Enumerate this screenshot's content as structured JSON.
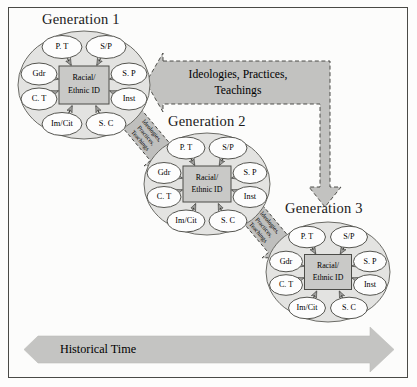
{
  "figure": {
    "border_color": "#4a4a46",
    "background": "#fcfcfb"
  },
  "palette": {
    "cluster_fill": "#e3e3e1",
    "cluster_stroke": "#6b6b66",
    "node_fill": "#fdfdfd",
    "node_stroke": "#555550",
    "center_fill": "#c9c9c7",
    "center_stroke": "#4c4c48",
    "arrow_fill": "#b9b9b7",
    "arrow_stroke": "#3a3a36",
    "big_arrow_fill": "#c2c2c0",
    "hist_arrow_fill": "#c4c4c2",
    "text": "#17171a"
  },
  "generations": [
    {
      "id": "generation-1",
      "title": "Generation 1",
      "center": {
        "line1": "Racial/",
        "line2": "Ethnic ID"
      },
      "nodes": [
        {
          "key": "pt",
          "label": "P. T",
          "position": "top-left"
        },
        {
          "key": "sp_top",
          "label": "S/P",
          "position": "top-right"
        },
        {
          "key": "gdr",
          "label": "Gdr",
          "position": "left-upper"
        },
        {
          "key": "sp_rt",
          "label": "S. P",
          "position": "right-upper"
        },
        {
          "key": "ct",
          "label": "C. T",
          "position": "left-lower"
        },
        {
          "key": "inst",
          "label": "Inst",
          "position": "right-lower"
        },
        {
          "key": "imcit",
          "label": "Im/Cit",
          "position": "bottom-left"
        },
        {
          "key": "sc",
          "label": "S. C",
          "position": "bottom-right"
        }
      ]
    },
    {
      "id": "generation-2",
      "title": "Generation 2",
      "center": {
        "line1": "Racial/",
        "line2": "Ethnic ID"
      },
      "nodes": [
        {
          "key": "pt",
          "label": "P. T",
          "position": "top-left"
        },
        {
          "key": "sp_top",
          "label": "S/P",
          "position": "top-right"
        },
        {
          "key": "gdr",
          "label": "Gdr",
          "position": "left-upper"
        },
        {
          "key": "sp_rt",
          "label": "S. P",
          "position": "right-upper"
        },
        {
          "key": "ct",
          "label": "C. T",
          "position": "left-lower"
        },
        {
          "key": "inst",
          "label": "Inst",
          "position": "right-lower"
        },
        {
          "key": "imcit",
          "label": "Im/Cit",
          "position": "bottom-left"
        },
        {
          "key": "sc",
          "label": "S. C",
          "position": "bottom-right"
        }
      ]
    },
    {
      "id": "generation-3",
      "title": "Generation 3",
      "center": {
        "line1": "Racial/",
        "line2": "Ethnic ID"
      },
      "nodes": [
        {
          "key": "pt",
          "label": "P. T",
          "position": "top-left"
        },
        {
          "key": "sp_top",
          "label": "S/P",
          "position": "top-right"
        },
        {
          "key": "gdr",
          "label": "Gdr",
          "position": "left-upper"
        },
        {
          "key": "sp_rt",
          "label": "S. P",
          "position": "right-upper"
        },
        {
          "key": "ct",
          "label": "C. T",
          "position": "left-lower"
        },
        {
          "key": "inst",
          "label": "Inst",
          "position": "right-lower"
        },
        {
          "key": "imcit",
          "label": "Im/Cit",
          "position": "bottom-left"
        },
        {
          "key": "sc",
          "label": "S. C",
          "position": "bottom-right"
        }
      ]
    }
  ],
  "big_arrow": {
    "id": "ideologies-arrow",
    "line1": "Ideologies, Practices,",
    "line2": "Teachings",
    "style": "dashed-outline-elbow-arrow"
  },
  "diagonal_arrows": [
    {
      "id": "diagonal-arrow-1-2",
      "line1": "Ideologies,",
      "line2": "Practices,",
      "line3": "Teachings"
    },
    {
      "id": "diagonal-arrow-2-3",
      "line1": "Ideologies,",
      "line2": "Practices,",
      "line3": "Teachings"
    }
  ],
  "historical_time": {
    "id": "historical-time-arrow",
    "label": "Historical Time",
    "direction": "right"
  }
}
